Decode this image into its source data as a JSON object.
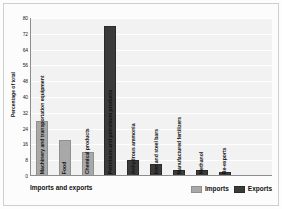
{
  "chart_data": {
    "type": "bar",
    "title": "",
    "xlabel": "Imports and exports",
    "ylabel": "Percentage of total",
    "ylim": [
      0,
      80
    ],
    "yticks": [
      0,
      8,
      16,
      24,
      32,
      40,
      48,
      56,
      64,
      72,
      80
    ],
    "grid": true,
    "legend_position": "bottom-right",
    "categories": [
      "Machinery and transportation equipment",
      "Food",
      "Chemical products",
      "Petroleum and petroleum products",
      "Anhydrous ammonia",
      "Iron and steel bars",
      "Manufactured fertilizers",
      "Methanol",
      "Re-exports"
    ],
    "series": [
      {
        "name": "Imports",
        "color": "#a8a8a8",
        "values": [
          28,
          18,
          12,
          null,
          null,
          null,
          null,
          null,
          null
        ]
      },
      {
        "name": "Exports",
        "color": "#3b3b3b",
        "values": [
          null,
          null,
          null,
          76,
          8,
          6,
          3,
          3,
          2
        ]
      }
    ],
    "bars": [
      {
        "label": "Machinery and transportation equipment",
        "value": 28,
        "series": "Imports"
      },
      {
        "label": "Food",
        "value": 18,
        "series": "Imports"
      },
      {
        "label": "Chemical products",
        "value": 12,
        "series": "Imports"
      },
      {
        "label": "Petroleum and petroleum products",
        "value": 76,
        "series": "Exports"
      },
      {
        "label": "Anhydrous ammonia",
        "value": 8,
        "series": "Exports"
      },
      {
        "label": "Iron and steel bars",
        "value": 6,
        "series": "Exports"
      },
      {
        "label": "Manufactured fertilizers",
        "value": 3,
        "series": "Exports"
      },
      {
        "label": "Methanol",
        "value": 3,
        "series": "Exports"
      },
      {
        "label": "Re-exports",
        "value": 2,
        "series": "Exports"
      }
    ],
    "legend": [
      {
        "label": "Imports",
        "color": "#a8a8a8"
      },
      {
        "label": "Exports",
        "color": "#3b3b3b"
      }
    ]
  }
}
